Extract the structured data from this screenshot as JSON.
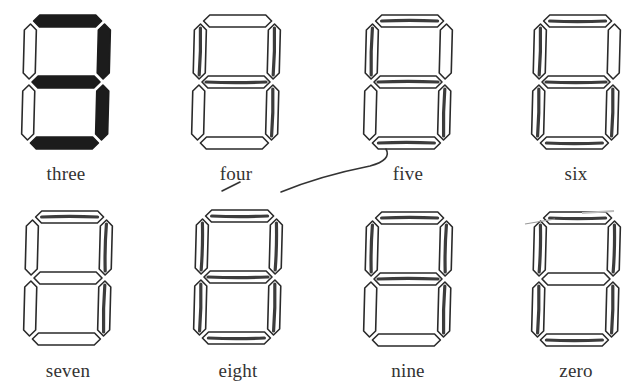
{
  "figure": {
    "segment_order": [
      "a",
      "b",
      "c",
      "d",
      "e",
      "f",
      "g"
    ],
    "digits": [
      {
        "label": "three",
        "value": 3,
        "active": [
          "a",
          "b",
          "c",
          "d",
          "g"
        ],
        "style": "filled",
        "x": 22,
        "y": 14
      },
      {
        "label": "four",
        "value": 4,
        "active": [
          "f",
          "g",
          "b",
          "c"
        ],
        "style": "pencil",
        "x": 192,
        "y": 14
      },
      {
        "label": "five",
        "value": 5,
        "active": [
          "a",
          "f",
          "g",
          "c",
          "d"
        ],
        "style": "pencil",
        "x": 364,
        "y": 14
      },
      {
        "label": "six",
        "value": 6,
        "active": [
          "a",
          "f",
          "g",
          "e",
          "c",
          "d"
        ],
        "style": "pencil",
        "x": 532,
        "y": 14
      },
      {
        "label": "seven",
        "value": 7,
        "active": [
          "a",
          "b",
          "c"
        ],
        "style": "pencil",
        "x": 24,
        "y": 210
      },
      {
        "label": "eight",
        "value": 8,
        "active": [
          "a",
          "b",
          "c",
          "d",
          "e",
          "f",
          "g"
        ],
        "style": "pencil",
        "x": 194,
        "y": 209
      },
      {
        "label": "nine",
        "value": 9,
        "active": [
          "a",
          "b",
          "c",
          "f",
          "g"
        ],
        "style": "pencil",
        "x": 364,
        "y": 211
      },
      {
        "label": "zero",
        "value": 0,
        "active": [
          "a",
          "b",
          "c",
          "d",
          "e",
          "f"
        ],
        "style": "pencil",
        "x": 532,
        "y": 211
      }
    ],
    "labels_row1_y": 163,
    "labels_row2_y": 360,
    "colors": {
      "ink": "#1c1c1c",
      "outline": "#2a2a2a",
      "label_text": "#333333",
      "background": "#ffffff"
    }
  }
}
